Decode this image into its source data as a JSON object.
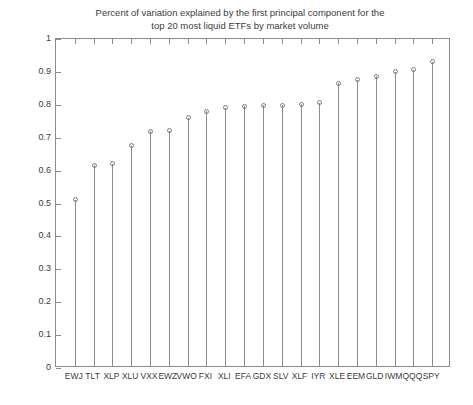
{
  "chart_data": {
    "type": "scatter",
    "title": "Percent of variation explained by the first principal component for the\ntop 20 most liquid ETFs by market volume",
    "title_line1": "Percent of variation explained by the first principal component for the",
    "title_line2": "top 20 most liquid ETFs by market volume",
    "xlabel": "",
    "ylabel": "",
    "ylim": [
      0,
      1
    ],
    "grid": false,
    "legend": null,
    "marker_style": "open-circle",
    "stem_plot": true,
    "colors": {
      "axis": "#8c8c8c",
      "stem": "#8c8c8c",
      "marker": "#7d7d7d",
      "text": "#3c3c3c",
      "background": "#ffffff"
    },
    "ytick_labels": [
      "0",
      "0.1",
      "0.2",
      "0.3",
      "0.4",
      "0.5",
      "0.6",
      "0.7",
      "0.8",
      "0.9",
      "1"
    ],
    "ytick_values": [
      0,
      0.1,
      0.2,
      0.3,
      0.4,
      0.5,
      0.6,
      0.7,
      0.8,
      0.9,
      1
    ],
    "categories": [
      "EWJ",
      "TLT",
      "XLP",
      "XLU",
      "VXX",
      "EWZ",
      "VWO",
      "FXI",
      "XLI",
      "EFA",
      "GDX",
      "SLV",
      "XLF",
      "IYR",
      "XLE",
      "EEM",
      "GLD",
      "IWM",
      "QQQ",
      "SPY"
    ],
    "values": [
      0.505,
      0.61,
      0.615,
      0.67,
      0.713,
      0.715,
      0.755,
      0.775,
      0.785,
      0.79,
      0.792,
      0.793,
      0.795,
      0.8,
      0.86,
      0.87,
      0.88,
      0.895,
      0.9,
      0.925
    ]
  }
}
